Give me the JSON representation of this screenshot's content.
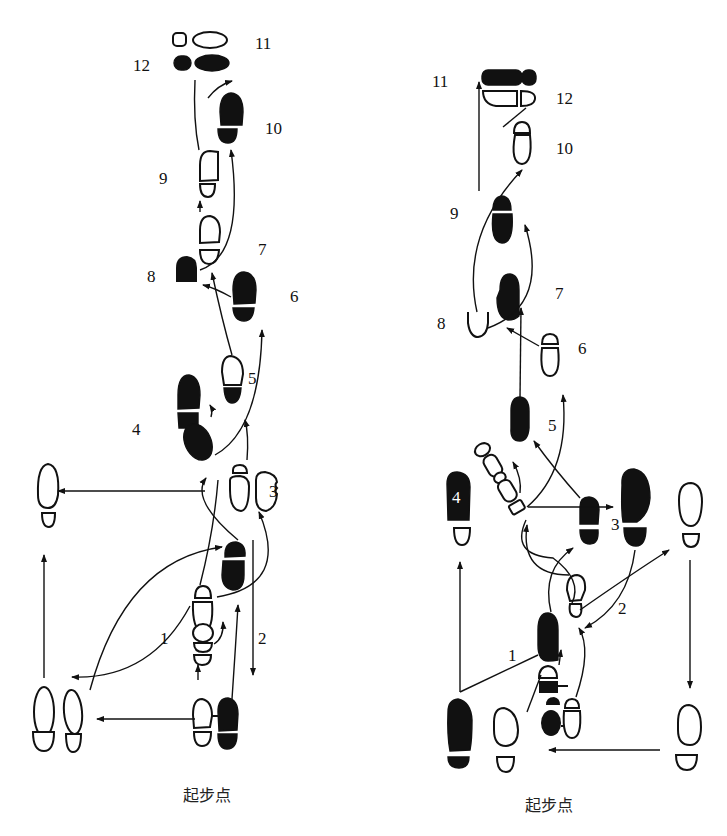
{
  "diagram": {
    "type": "dance-footstep-pattern",
    "ink_color": "#111111",
    "background": "#ffffff",
    "left_panel": {
      "caption": "起步点",
      "step_labels": [
        "1",
        "2",
        "3",
        "4",
        "5",
        "6",
        "7",
        "8",
        "9",
        "10",
        "11",
        "12"
      ]
    },
    "right_panel": {
      "caption": "起步点",
      "step_labels": [
        "1",
        "2",
        "3",
        "4",
        "5",
        "6",
        "7",
        "8",
        "9",
        "10",
        "11",
        "12"
      ]
    }
  }
}
